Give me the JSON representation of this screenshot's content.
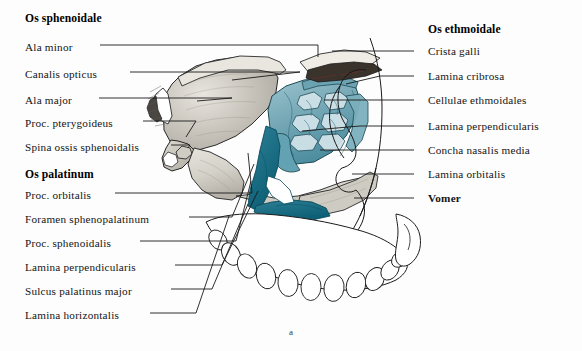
{
  "figure": {
    "caption": "a",
    "background_color": "#fdfdfd",
    "bone_color": "#d9d6cf",
    "bone_shadow_color": "#9c988f",
    "ethmoid_color": "#7fb0bc",
    "ethmoid_dark_color": "#2f7f92",
    "ethmoid_deep_color": "#0f6a80",
    "outline_color": "#1a1a1a"
  },
  "left_groups": [
    {
      "header": "Os sphenoidale",
      "header_y": 20,
      "items": [
        {
          "label": "Ala minor",
          "y": 48,
          "text_end_x": 96,
          "target_x": 318,
          "target_y": 57
        },
        {
          "label": "Canalis opticus",
          "y": 75,
          "text_end_x": 126,
          "target_x": 230,
          "target_y": 80
        },
        {
          "label": "Ala major",
          "y": 101,
          "text_end_x": 95,
          "target_x": 197,
          "target_y": 101
        },
        {
          "label": "Proc. pterygoideus",
          "y": 124,
          "text_end_x": 139,
          "target_x": 185,
          "target_y": 137
        },
        {
          "label": "Spina ossis sphenoidalis",
          "y": 148,
          "text_end_x": 167,
          "target_x": 187,
          "target_y": 148
        }
      ]
    },
    {
      "header": "Os palatinum",
      "header_y": 175,
      "items": [
        {
          "label": "Proc. orbitalis",
          "y": 196,
          "text_end_x": 111,
          "target_x": 247,
          "target_y": 152
        },
        {
          "label": "Foramen sphenopalatinum",
          "y": 220,
          "text_end_x": 185,
          "target_x": 253,
          "target_y": 163
        },
        {
          "label": "Proc. sphenoidalis",
          "y": 244,
          "text_end_x": 136,
          "target_x": 250,
          "target_y": 180
        },
        {
          "label": "Lamina perpendicularis",
          "y": 268,
          "text_end_x": 171,
          "target_x": 257,
          "target_y": 190
        },
        {
          "label": "Sulcus palatinus major",
          "y": 292,
          "text_end_x": 167,
          "target_x": 247,
          "target_y": 203
        },
        {
          "label": "Lamina horizontalis",
          "y": 316,
          "text_end_x": 146,
          "target_x": 228,
          "target_y": 215
        }
      ]
    }
  ],
  "right_groups": [
    {
      "header": "Os ethmoidale",
      "header_x": 428,
      "header_y": 30,
      "items": [
        {
          "label": "Crista galli",
          "y": 54,
          "text_x": 428,
          "dash_x": 414,
          "target_x": 332,
          "target_y": 50
        },
        {
          "label": "Lamina cribrosa",
          "y": 79,
          "text_x": 428,
          "dash_x": 414,
          "target_x": 344,
          "target_y": 84
        },
        {
          "label": "Cellulae ethmoidales",
          "y": 103,
          "text_x": 428,
          "dash_x": 414,
          "target_x": 322,
          "target_y": 100
        },
        {
          "label": "Lamina perpendicularis",
          "y": 129,
          "text_x": 428,
          "dash_x": 414,
          "target_x": 300,
          "target_y": 131
        },
        {
          "label": "Concha nasalis media",
          "y": 153,
          "text_x": 428,
          "dash_x": 414,
          "target_x": 318,
          "target_y": 153
        },
        {
          "label": "Lamina orbitalis",
          "y": 177,
          "text_x": 428,
          "dash_x": 414,
          "target_x": 350,
          "target_y": 177
        },
        {
          "label": "Vomer",
          "y": 201,
          "text_x": 428,
          "dash_x": 414,
          "target_x": 352,
          "target_y": 201,
          "bold": true
        }
      ]
    }
  ]
}
